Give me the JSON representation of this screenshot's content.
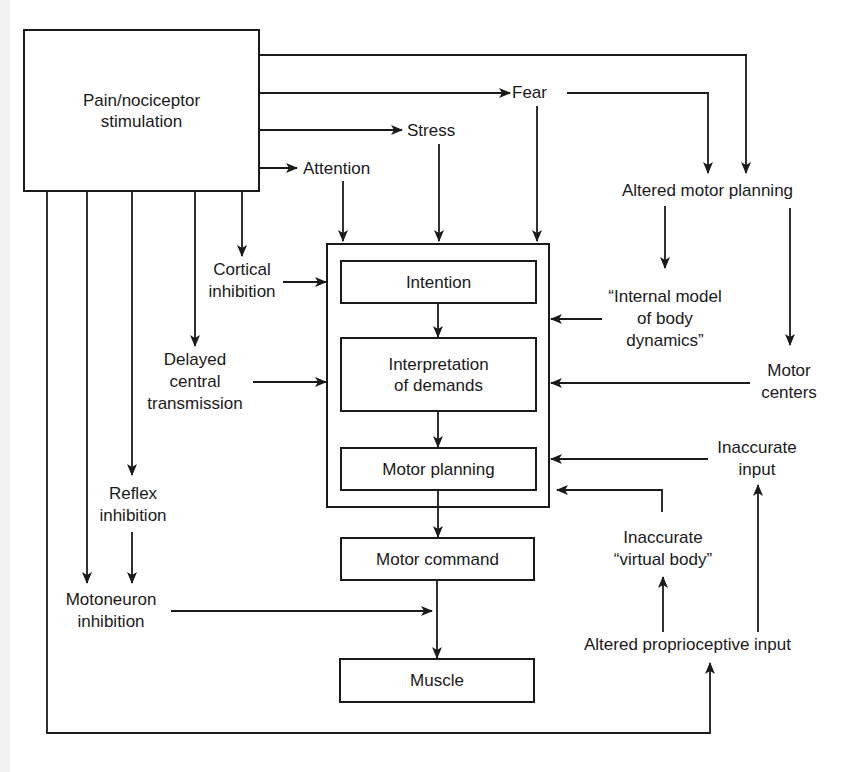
{
  "diagram": {
    "type": "flow-diagram",
    "nodes": {
      "pain": "Pain/nociceptor\nstimulation",
      "fear": "Fear",
      "stress": "Stress",
      "attention": "Attention",
      "altered_motor_planning": "Altered motor planning",
      "cortical_inhibition": "Cortical\ninhibition",
      "delayed_central_transmission": "Delayed\ncentral\ntransmission",
      "reflex_inhibition": "Reflex\ninhibition",
      "motoneuron_inhibition": "Motoneuron\ninhibition",
      "intention": "Intention",
      "interpretation_of_demands": "Interpretation\nof demands",
      "motor_planning": "Motor planning",
      "motor_command": "Motor command",
      "muscle": "Muscle",
      "internal_model": "“Internal model\nof body\ndynamics”",
      "motor_centers": "Motor\ncenters",
      "inaccurate_input": "Inaccurate\ninput",
      "inaccurate_virtual_body": "Inaccurate\n“virtual body”",
      "altered_proprioceptive_input": "Altered proprioceptive input"
    },
    "edges": [
      {
        "from": "pain",
        "to": "altered_motor_planning"
      },
      {
        "from": "pain",
        "to": "fear"
      },
      {
        "from": "pain",
        "to": "stress"
      },
      {
        "from": "pain",
        "to": "attention"
      },
      {
        "from": "pain",
        "to": "cortical_inhibition"
      },
      {
        "from": "pain",
        "to": "delayed_central_transmission"
      },
      {
        "from": "pain",
        "to": "reflex_inhibition"
      },
      {
        "from": "pain",
        "to": "motoneuron_inhibition"
      },
      {
        "from": "pain",
        "to": "altered_proprioceptive_input"
      },
      {
        "from": "fear",
        "to": "altered_motor_planning"
      },
      {
        "from": "fear",
        "to": "central_process"
      },
      {
        "from": "stress",
        "to": "central_process"
      },
      {
        "from": "attention",
        "to": "central_process"
      },
      {
        "from": "altered_motor_planning",
        "to": "internal_model"
      },
      {
        "from": "altered_motor_planning",
        "to": "motor_centers"
      },
      {
        "from": "cortical_inhibition",
        "to": "central_process"
      },
      {
        "from": "delayed_central_transmission",
        "to": "central_process"
      },
      {
        "from": "internal_model",
        "to": "central_process"
      },
      {
        "from": "motor_centers",
        "to": "central_process"
      },
      {
        "from": "inaccurate_input",
        "to": "central_process"
      },
      {
        "from": "inaccurate_virtual_body",
        "to": "central_process"
      },
      {
        "from": "intention",
        "to": "interpretation_of_demands"
      },
      {
        "from": "interpretation_of_demands",
        "to": "motor_planning"
      },
      {
        "from": "motor_planning",
        "to": "motor_command"
      },
      {
        "from": "motor_command",
        "to": "muscle"
      },
      {
        "from": "reflex_inhibition",
        "to": "motoneuron_inhibition"
      },
      {
        "from": "motoneuron_inhibition",
        "to": "muscle"
      },
      {
        "from": "altered_proprioceptive_input",
        "to": "inaccurate_virtual_body"
      },
      {
        "from": "altered_proprioceptive_input",
        "to": "inaccurate_input"
      }
    ]
  },
  "colors": {
    "line": "#1a1a1a",
    "background": "#ffffff"
  }
}
